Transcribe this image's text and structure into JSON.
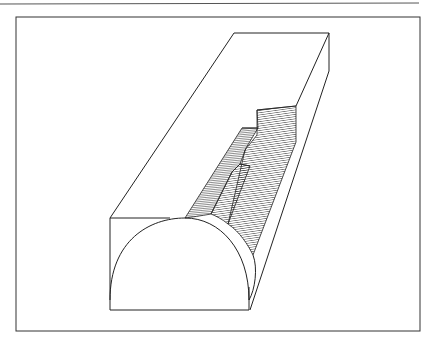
{
  "figure": {
    "colors": {
      "background": "#ffffff",
      "line": "#222222",
      "hatch": "#333333"
    },
    "top_rule": {
      "x1": 0,
      "y1": 4,
      "x2": 419,
      "y2": 3
    },
    "frame": {
      "x": 16,
      "y": 17,
      "width": 404,
      "height": 314
    }
  }
}
